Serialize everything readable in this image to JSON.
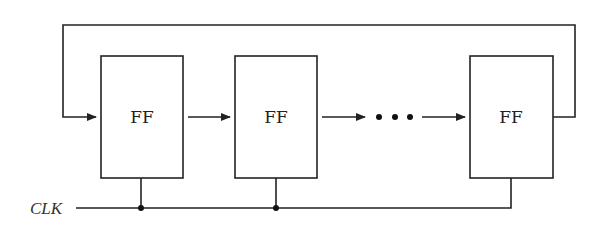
{
  "diagram": {
    "type": "ring-counter-shift-register",
    "flip_flops": [
      {
        "label": "FF",
        "x": 101,
        "y": 56,
        "w": 82,
        "h": 122
      },
      {
        "label": "FF",
        "x": 235,
        "y": 56,
        "w": 82,
        "h": 122
      },
      {
        "label": "FF",
        "x": 470,
        "y": 56,
        "w": 83,
        "h": 122
      }
    ],
    "ellipsis": "• • •",
    "clock_label": "CLK",
    "colors": {
      "line": "#222222",
      "background": "#ffffff"
    }
  }
}
